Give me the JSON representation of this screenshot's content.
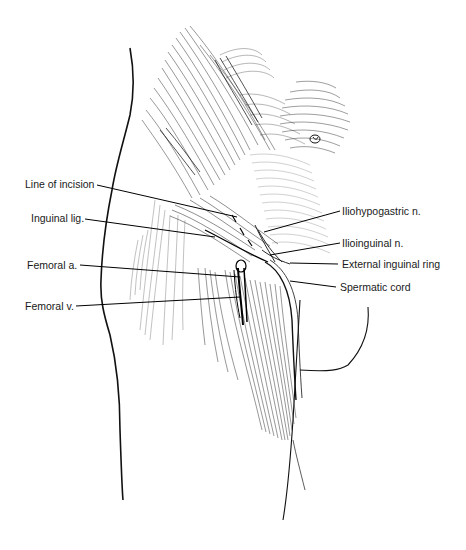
{
  "figure": {
    "labels": [
      {
        "id": "line-of-incision",
        "text": "Line of incision",
        "x": 25,
        "y": 178,
        "side": "left"
      },
      {
        "id": "inguinal-lig",
        "text": "Inguinal lig.",
        "x": 31,
        "y": 212,
        "side": "left"
      },
      {
        "id": "femoral-a",
        "text": "Femoral a.",
        "x": 27,
        "y": 259,
        "side": "left"
      },
      {
        "id": "femoral-v",
        "text": "Femoral v.",
        "x": 25,
        "y": 300,
        "side": "left"
      },
      {
        "id": "iliohypogastric-n",
        "text": "Iliohypogastric n.",
        "x": 342,
        "y": 205,
        "side": "right"
      },
      {
        "id": "ilioinguinal-n",
        "text": "Ilioinguinal n.",
        "x": 342,
        "y": 237,
        "side": "right"
      },
      {
        "id": "external-inguinal-ring",
        "text": "External inguinal ring",
        "x": 342,
        "y": 258,
        "side": "right"
      },
      {
        "id": "spermatic-cord",
        "text": "Spermatic cord",
        "x": 340,
        "y": 281,
        "side": "right"
      }
    ],
    "leaders": [
      {
        "id": "line-of-incision",
        "x1": 97,
        "y1": 185,
        "x2": 237,
        "y2": 217
      },
      {
        "id": "inguinal-lig",
        "x1": 85,
        "y1": 219,
        "x2": 215,
        "y2": 237
      },
      {
        "id": "femoral-a",
        "x1": 80,
        "y1": 265,
        "x2": 240,
        "y2": 277
      },
      {
        "id": "femoral-v",
        "x1": 76,
        "y1": 306,
        "x2": 240,
        "y2": 297
      },
      {
        "id": "iliohypogastric-n",
        "x1": 340,
        "y1": 211,
        "x2": 264,
        "y2": 232
      },
      {
        "id": "ilioinguinal-n",
        "x1": 340,
        "y1": 243,
        "x2": 270,
        "y2": 255
      },
      {
        "id": "external-inguinal-ring",
        "x1": 338,
        "y1": 264,
        "x2": 290,
        "y2": 263
      },
      {
        "id": "spermatic-cord",
        "x1": 336,
        "y1": 287,
        "x2": 290,
        "y2": 281
      }
    ]
  }
}
